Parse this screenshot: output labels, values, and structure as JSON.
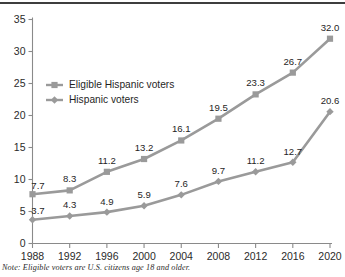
{
  "chart_data": {
    "type": "line",
    "title": "",
    "subtitle": "",
    "xlabel": "",
    "ylabel": "",
    "categories": [
      "1988",
      "1992",
      "1996",
      "2000",
      "2004",
      "2008",
      "2012",
      "2016",
      "2020"
    ],
    "x": [
      1988,
      1992,
      1996,
      2000,
      2004,
      2008,
      2012,
      2016,
      2020
    ],
    "series": [
      {
        "name": "Eligible Hispanic voters",
        "marker": "square",
        "color": "#9a9a9a",
        "values": [
          7.7,
          8.3,
          11.2,
          13.2,
          16.1,
          19.5,
          23.3,
          26.7,
          32.0
        ],
        "labels": [
          "7.7",
          "8.3",
          "11.2",
          "13.2",
          "16.1",
          "19.5",
          "23.3",
          "26.7",
          "32.0"
        ]
      },
      {
        "name": "Hispanic voters",
        "marker": "diamond",
        "color": "#9a9a9a",
        "values": [
          3.7,
          4.3,
          4.9,
          5.9,
          7.6,
          9.7,
          11.2,
          12.7,
          20.6
        ],
        "labels": [
          "3.7",
          "4.3",
          "4.9",
          "5.9",
          "7.6",
          "9.7",
          "11.2",
          "12.7",
          "20.6"
        ]
      }
    ],
    "ylim": [
      0,
      35
    ],
    "yticks": [
      0,
      5,
      10,
      15,
      20,
      25,
      30,
      35
    ],
    "ytick_labels": [
      "0",
      "5",
      "10",
      "15",
      "20",
      "25",
      "30",
      "35"
    ],
    "xtick_labels": [
      "1988",
      "1992",
      "1996",
      "2000",
      "2004",
      "2008",
      "2012",
      "2016",
      "2020"
    ],
    "grid": false,
    "legend_position": "upper-left-inside"
  },
  "legend": {
    "entries": [
      {
        "label": "Eligible Hispanic voters"
      },
      {
        "label": "Hispanic voters"
      }
    ]
  },
  "note": {
    "label": "Note:",
    "text": "Eligible voters are U.S. citizens age 18 and older.",
    "full": "Note: Eligible voters are U.S. citizens age 18 and older."
  }
}
